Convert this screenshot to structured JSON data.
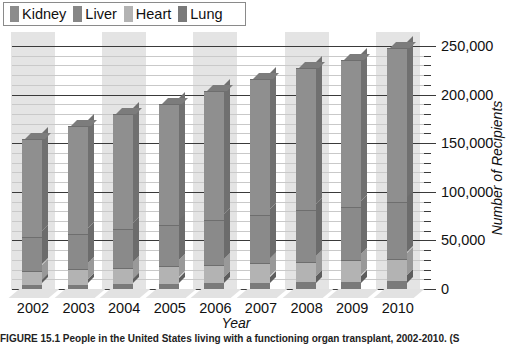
{
  "legend": {
    "items": [
      {
        "label": "Kidney",
        "color": "#8c8c8c"
      },
      {
        "label": "Liver",
        "color": "#878787"
      },
      {
        "label": "Heart",
        "color": "#b3b3b3"
      },
      {
        "label": "Lung",
        "color": "#7a7a7a"
      }
    ]
  },
  "axes": {
    "y_tick_labels": [
      "0",
      "50,000",
      "100,000",
      "150,000",
      "200,000",
      "250,000"
    ],
    "y_label": "Number of Recipients",
    "x_label": "Year",
    "x_tick_labels": [
      "2002",
      "2003",
      "2004",
      "2005",
      "2006",
      "2007",
      "2008",
      "2009",
      "2010"
    ]
  },
  "caption": "FIGURE 15.1 People in the United States living with a functioning organ transplant, 2002-2010. (S",
  "chart_data": {
    "type": "bar",
    "stacked": true,
    "style": "3d-column",
    "title": "",
    "xlabel": "Year",
    "ylabel": "Number of Recipients",
    "ylim": [
      0,
      250000
    ],
    "y_ticks": [
      0,
      50000,
      100000,
      150000,
      200000,
      250000
    ],
    "y_axis_position": "right",
    "grid": true,
    "legend_position": "top-left",
    "categories": [
      "2002",
      "2003",
      "2004",
      "2005",
      "2006",
      "2007",
      "2008",
      "2009",
      "2010"
    ],
    "series": [
      {
        "name": "Lung",
        "values": [
          4000,
          4500,
          5000,
          5500,
          6000,
          6500,
          7000,
          7500,
          8000
        ]
      },
      {
        "name": "Heart",
        "values": [
          15000,
          16000,
          17000,
          18000,
          19000,
          20000,
          21000,
          22000,
          23000
        ]
      },
      {
        "name": "Liver",
        "values": [
          34000,
          36000,
          40000,
          42000,
          46000,
          50000,
          53000,
          55000,
          58000
        ]
      },
      {
        "name": "Kidney",
        "values": [
          101000,
          111000,
          118000,
          125000,
          133000,
          140000,
          146000,
          151000,
          159000
        ]
      }
    ],
    "totals": [
      154000,
      167500,
      180000,
      190500,
      204000,
      216500,
      227000,
      235500,
      248000
    ]
  }
}
